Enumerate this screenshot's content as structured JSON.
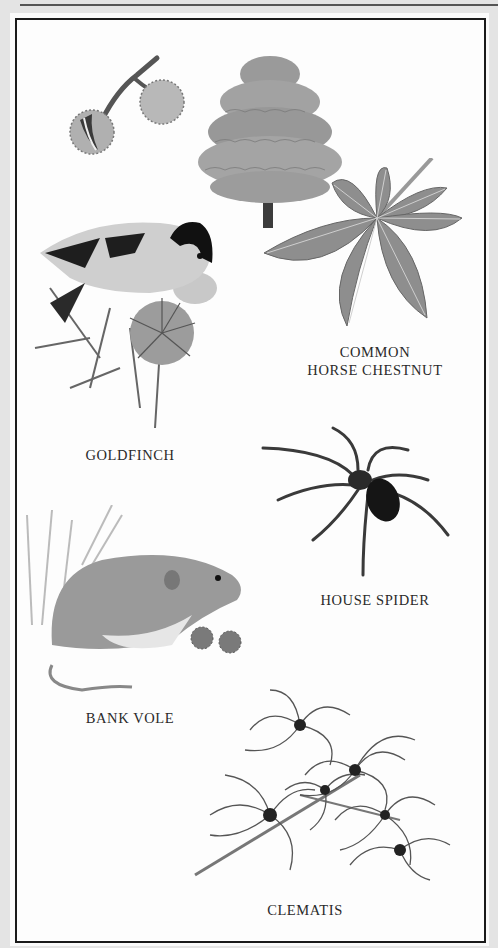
{
  "page": {
    "background": "#e4e4e4",
    "frame_color": "#1a1a1a",
    "palette": "grayscale"
  },
  "specimens": [
    {
      "id": "horse-chestnut",
      "label_line1": "COMMON",
      "label_line2": "HORSE CHESTNUT",
      "illustrations": [
        "conker-pods-icon",
        "chestnut-tree-icon",
        "palmate-leaf-icon"
      ]
    },
    {
      "id": "goldfinch",
      "label": "GOLDFINCH",
      "illustrations": [
        "goldfinch-on-thistle-icon"
      ]
    },
    {
      "id": "house-spider",
      "label": "HOUSE SPIDER",
      "illustrations": [
        "spider-icon"
      ]
    },
    {
      "id": "bank-vole",
      "label": "BANK VOLE",
      "illustrations": [
        "vole-icon"
      ]
    },
    {
      "id": "clematis",
      "label": "CLEMATIS",
      "illustrations": [
        "clematis-seedheads-icon"
      ]
    }
  ]
}
